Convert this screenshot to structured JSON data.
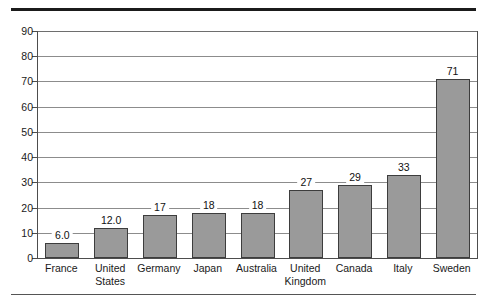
{
  "chart_data": {
    "type": "bar",
    "title": "",
    "subtitle": "",
    "xlabel": "",
    "ylabel": "",
    "ylim": [
      0,
      90
    ],
    "ytick_step": 10,
    "yticks": [
      "90",
      "80",
      "70",
      "60",
      "50",
      "40",
      "30",
      "20",
      "10",
      "0"
    ],
    "grid": "horizontal",
    "legend": "none",
    "categories": [
      "France",
      "United States",
      "Germany",
      "Japan",
      "Australia",
      "United Kingdom",
      "Canada",
      "Italy",
      "Sweden"
    ],
    "category_lines": [
      [
        "France"
      ],
      [
        "United",
        "States"
      ],
      [
        "Germany"
      ],
      [
        "Japan"
      ],
      [
        "Australia"
      ],
      [
        "United",
        "Kingdom"
      ],
      [
        "Canada"
      ],
      [
        "Italy"
      ],
      [
        "Sweden"
      ]
    ],
    "values": [
      6.0,
      12.0,
      17,
      18,
      18,
      27,
      29,
      33,
      71
    ],
    "data_labels": [
      "6.0",
      "12.0",
      "17",
      "18",
      "18",
      "27",
      "29",
      "33",
      "71"
    ],
    "colors": {
      "bar_fill": "#9a9a9a",
      "bar_stroke": "#3d3d3d",
      "gridline": "#8c8c8c",
      "axis": "#4d4d4d",
      "rule_top": "#1b1b1b",
      "rule_bottom": "#555555",
      "background": "#ffffff",
      "text": "#1a1a1a"
    }
  }
}
